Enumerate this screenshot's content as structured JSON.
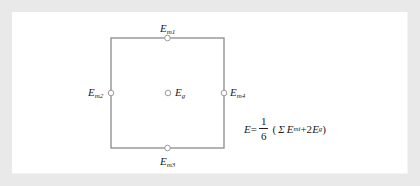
{
  "diagram": {
    "type": "measurement-point-layout",
    "shape": "square",
    "colors": {
      "background": "#e9e9e9",
      "panel": "#ffffff",
      "lines": "#8a8a8a",
      "text": "#222222"
    },
    "points": [
      {
        "id": "Em1",
        "base": "E",
        "sub": "m1",
        "position": "top-midpoint"
      },
      {
        "id": "Em2",
        "base": "E",
        "sub": "m2",
        "position": "left-midpoint"
      },
      {
        "id": "Em3",
        "base": "E",
        "sub": "m3",
        "position": "bottom-midpoint"
      },
      {
        "id": "Em4",
        "base": "E",
        "sub": "m4",
        "position": "right-midpoint"
      },
      {
        "id": "Eg",
        "base": "E",
        "sub": "g",
        "position": "center"
      }
    ],
    "formula": {
      "lhs": "E",
      "equals": "=",
      "numerator": "1",
      "denominator": "6",
      "open": "(",
      "sum": "Σ",
      "term1_base": "E",
      "term1_sub": "mi",
      "plus": "+2",
      "term2_base": "E",
      "term2_sub": "g",
      "close": ")"
    }
  }
}
